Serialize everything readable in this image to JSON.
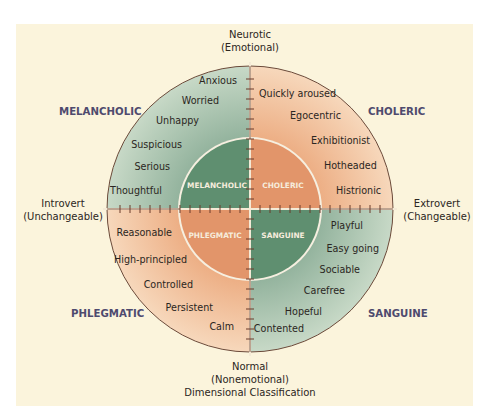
{
  "diagram": {
    "title": "Dimensional Classification",
    "axes": {
      "top": [
        "Neurotic",
        "(Emotional)"
      ],
      "bottom": [
        "Normal",
        "(Nonemotional)",
        "Dimensional Classification"
      ],
      "left": [
        "Introvert",
        "(Unchangeable)"
      ],
      "right": [
        "Extrovert",
        "(Changeable)"
      ]
    },
    "quadrants": {
      "melancholic": {
        "outer_label": "MELANCHOLIC",
        "inner_label": "MELANCHOLIC",
        "traits": [
          "Anxious",
          "Worried",
          "Unhappy",
          "Suspicious",
          "Serious",
          "Thoughtful"
        ]
      },
      "choleric": {
        "outer_label": "CHOLERIC",
        "inner_label": "CHOLERIC",
        "traits": [
          "Quickly aroused",
          "Egocentric",
          "Exhibitionist",
          "Hotheaded",
          "Histrionic"
        ]
      },
      "phlegmatic": {
        "outer_label": "PHLEGMATIC",
        "inner_label": "PHLEGMATIC",
        "traits": [
          "Reasonable",
          "High-principled",
          "Controlled",
          "Persistent",
          "Calm"
        ]
      },
      "sanguine": {
        "outer_label": "SANGUINE",
        "inner_label": "SANGUINE",
        "traits": [
          "Playful",
          "Easy going",
          "Sociable",
          "Carefree",
          "Hopeful",
          "Contented"
        ]
      }
    },
    "colors": {
      "background": "#fbf4dc",
      "green_outer": "#b4cbb9",
      "green_inner": "#5f8f70",
      "orange_outer": "#f1c3a0",
      "orange_inner": "#e2956a",
      "axis_line": "#6b3a2a",
      "quadrant_label": "#4e4a6e"
    }
  }
}
